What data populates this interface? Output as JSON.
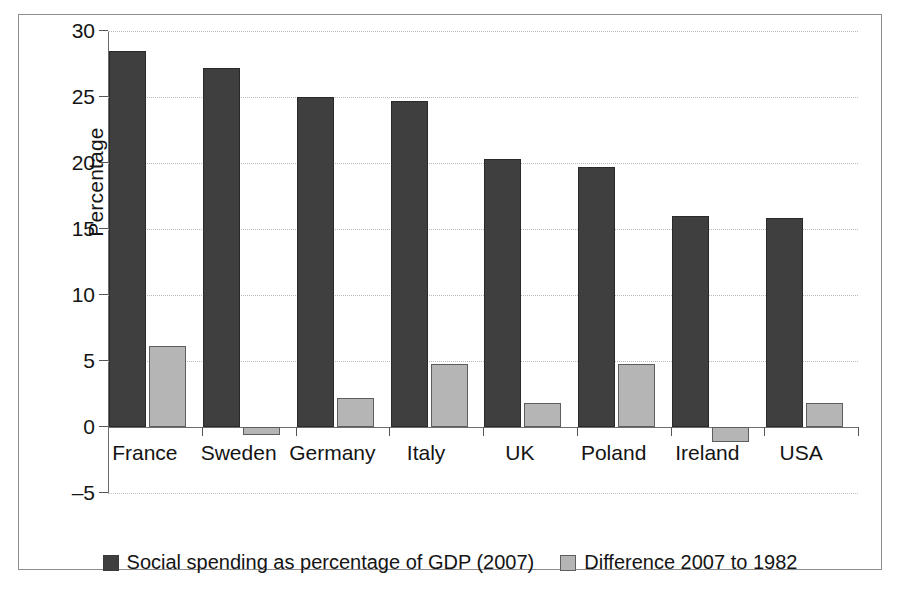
{
  "chart_data": {
    "type": "bar",
    "title": "",
    "subtitle": "",
    "xlabel": "",
    "ylabel": "Percentage",
    "ylim": [
      -5,
      30
    ],
    "yticks": [
      30,
      25,
      20,
      15,
      10,
      5,
      0,
      -5
    ],
    "ytick_labels": [
      "30",
      "25",
      "20",
      "15",
      "10",
      "5",
      "0",
      "–5"
    ],
    "grid": true,
    "grid_axis": "y",
    "legend_position": "bottom-center",
    "categories": [
      "France",
      "Sweden",
      "Germany",
      "Italy",
      "UK",
      "Poland",
      "Ireland",
      "USA"
    ],
    "series": [
      {
        "name": "Social spending as percentage of GDP (2007)",
        "color": "#3f3f3f",
        "values": [
          28.5,
          27.2,
          25.0,
          24.7,
          20.3,
          19.7,
          16.0,
          15.8
        ]
      },
      {
        "name": "Difference 2007 to 1982",
        "color": "#b5b5b5",
        "values": [
          6.1,
          -0.6,
          2.2,
          4.8,
          1.8,
          4.8,
          -1.1,
          1.8
        ]
      }
    ]
  },
  "legend": {
    "items": [
      {
        "label": "Social spending as percentage of GDP (2007)",
        "swatch": "dark-swatch"
      },
      {
        "label": "Difference 2007 to 1982",
        "swatch": "light-swatch"
      }
    ]
  },
  "axis": {
    "y_title": "Percentage"
  }
}
